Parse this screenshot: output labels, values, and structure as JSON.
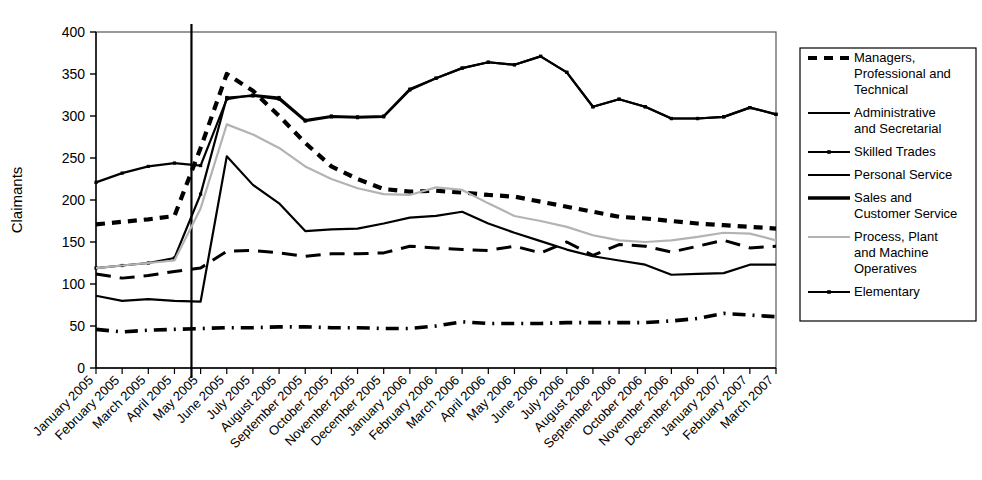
{
  "chart_data": {
    "type": "line",
    "title": "",
    "xlabel": "",
    "ylabel": "Claimants",
    "ylim": [
      0,
      400
    ],
    "ytick_step": 50,
    "yticks": [
      0,
      50,
      100,
      150,
      200,
      250,
      300,
      350,
      400
    ],
    "grid": false,
    "legend_position": "right",
    "annotations": [
      {
        "type": "vertical-line",
        "at_category": "May 2005",
        "offset": -0.35,
        "label": ""
      }
    ],
    "categories": [
      "January 2005",
      "February 2005",
      "March 2005",
      "April 2005",
      "May 2005",
      "June 2005",
      "July 2005",
      "August 2005",
      "September 2005",
      "October 2005",
      "November 2005",
      "December 2005",
      "January 2006",
      "February 2006",
      "March 2006",
      "April 2006",
      "May 2006",
      "June 2006",
      "July 2006",
      "August 2006",
      "September 2006",
      "October 2006",
      "November 2006",
      "December 2006",
      "January 2007",
      "February 2007",
      "March 2007"
    ],
    "series": [
      {
        "name": "Managers, Professional and Technical",
        "style": "dashed",
        "color": "#000000",
        "marker": "none",
        "values": [
          171,
          174,
          177,
          181,
          262,
          350,
          330,
          300,
          268,
          240,
          225,
          213,
          210,
          211,
          209,
          206,
          204,
          198,
          192,
          186,
          180,
          178,
          175,
          172,
          170,
          168,
          166
        ]
      },
      {
        "name": "Administrative and Secretarial",
        "style": "solid",
        "color": "#000000",
        "marker": "none",
        "values": [
          86,
          80,
          82,
          80,
          79,
          252,
          218,
          196,
          163,
          165,
          166,
          172,
          179,
          181,
          186,
          172,
          161,
          151,
          141,
          133,
          128,
          123,
          111,
          112,
          113,
          123,
          123
        ]
      },
      {
        "name": "Skilled Trades",
        "style": "solid",
        "color": "#000000",
        "marker": "dot",
        "values": [
          119,
          122,
          125,
          131,
          207,
          322,
          324,
          320,
          294,
          299,
          298,
          299,
          331,
          345,
          357,
          364,
          361,
          371,
          352,
          311,
          320,
          311,
          297,
          297,
          299,
          310,
          302
        ]
      },
      {
        "name": "Personal Service",
        "style": "dash-dot",
        "color": "#000000",
        "marker": "none",
        "values": [
          46,
          43,
          45,
          46,
          47,
          48,
          48,
          49,
          49,
          48,
          48,
          47,
          47,
          50,
          55,
          53,
          53,
          53,
          54,
          54,
          54,
          54,
          56,
          59,
          65,
          63,
          61
        ]
      },
      {
        "name": "Sales and Customer Service",
        "style": "long-dash",
        "color": "#000000",
        "marker": "none",
        "values": [
          112,
          107,
          110,
          115,
          119,
          139,
          140,
          137,
          133,
          136,
          136,
          137,
          145,
          143,
          141,
          140,
          145,
          137,
          150,
          134,
          147,
          145,
          138,
          145,
          152,
          143,
          145
        ]
      },
      {
        "name": "Process, Plant and Machine Operatives",
        "style": "solid",
        "color": "#b3b3b3",
        "marker": "none",
        "values": [
          119,
          122,
          125,
          128,
          190,
          290,
          278,
          262,
          240,
          225,
          214,
          207,
          206,
          215,
          212,
          196,
          181,
          175,
          168,
          158,
          152,
          150,
          152,
          156,
          161,
          160,
          152
        ]
      },
      {
        "name": "Elementary",
        "style": "solid",
        "color": "#000000",
        "marker": "dot",
        "values": [
          221,
          232,
          240,
          244,
          241,
          320,
          325,
          322,
          295,
          300,
          299,
          300,
          332,
          345,
          357,
          364,
          361,
          371,
          352,
          311,
          320,
          311,
          297,
          297,
          299,
          310,
          302
        ]
      }
    ],
    "legend_entries": [
      {
        "label": "Managers, Professional and Technical",
        "style": "dashed",
        "color": "#000000",
        "marker": "none"
      },
      {
        "label": "Administrative and Secretarial",
        "style": "solid",
        "color": "#000000",
        "marker": "none"
      },
      {
        "label": "Skilled Trades",
        "style": "solid",
        "color": "#000000",
        "marker": "dot"
      },
      {
        "label": "Personal Service",
        "style": "solid-thin",
        "color": "#000000",
        "marker": "none"
      },
      {
        "label": "Sales and Customer Service",
        "style": "solid-thick",
        "color": "#000000",
        "marker": "none"
      },
      {
        "label": "Process, Plant and Machine Operatives",
        "style": "solid",
        "color": "#b3b3b3",
        "marker": "none"
      },
      {
        "label": "Elementary",
        "style": "solid",
        "color": "#000000",
        "marker": "dot"
      }
    ]
  }
}
